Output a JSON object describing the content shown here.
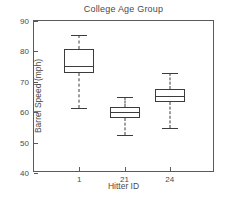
{
  "chart_data": {
    "type": "box",
    "title": "College Age Group",
    "xlabel": "Hitter ID",
    "ylabel": "Barrel Speed (mph)",
    "grid": false,
    "legend": null,
    "ylim": [
      40,
      90
    ],
    "yticks": [
      40,
      50,
      60,
      70,
      80,
      90
    ],
    "ytick_labels": [
      "40",
      "50",
      "60",
      "70",
      "80",
      "90"
    ],
    "categories": [
      "1",
      "21",
      "24"
    ],
    "boxes": [
      {
        "category": "1",
        "whisker_low": 61.4,
        "q1": 72.9,
        "median": 75.2,
        "q3": 80.8,
        "whisker_high": 85.4
      },
      {
        "category": "21",
        "whisker_low": 52.5,
        "q1": 58.1,
        "median": 60.1,
        "q3": 61.7,
        "whisker_high": 65.0
      },
      {
        "category": "24",
        "whisker_low": 54.8,
        "q1": 63.4,
        "median": 65.3,
        "q3": 67.6,
        "whisker_high": 72.9
      }
    ],
    "colors": {
      "axis": "#5a5a5a",
      "box_edge": "#3c3c3c",
      "text": "#4a4a4a",
      "background": "#ffffff"
    }
  }
}
